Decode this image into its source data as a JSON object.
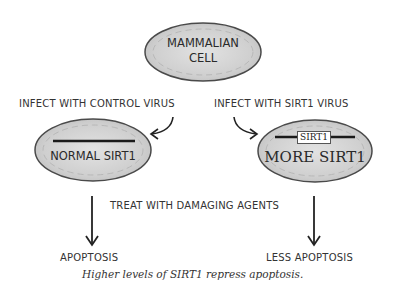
{
  "diagram": {
    "top_cell": {
      "line1": "MAMMALIAN",
      "line2": "CELL"
    },
    "left_branch": {
      "instruction": "INFECT WITH CONTROL VIRUS",
      "cell_label": "NORMAL SIRT1",
      "outcome": "APOPTOSIS"
    },
    "right_branch": {
      "instruction": "INFECT WITH SIRT1 VIRUS",
      "gene_tag": "SIRT1",
      "cell_label": "MORE SIRT1",
      "outcome": "LESS APOPTOSIS"
    },
    "treatment": "TREAT WITH DAMAGING AGENTS",
    "caption": "Higher levels of SIRT1 repress apoptosis."
  },
  "colors": {
    "cell_fill": "#d6d6d6",
    "cell_stroke": "#4a4a4a",
    "arrow": "#222222",
    "text": "#333333"
  }
}
